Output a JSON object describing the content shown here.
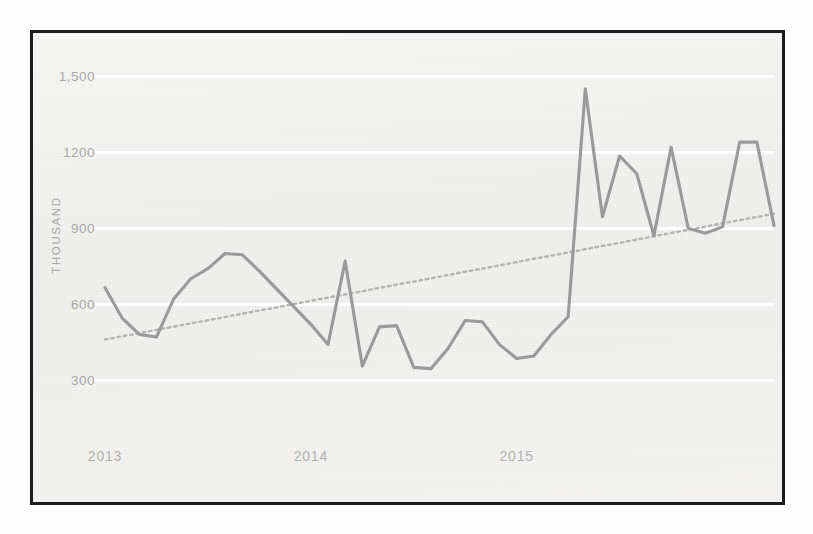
{
  "figure": {
    "frame_color": "#1c1c1c",
    "background_color": "#f2f2f0"
  },
  "chart_data": {
    "type": "line",
    "title": "",
    "subtitle": "",
    "xlabel": "",
    "ylabel": "THOUSAND",
    "ylim": [
      150,
      1600
    ],
    "yticks": [
      300,
      600,
      900,
      1200,
      1500
    ],
    "ytick_labels": [
      "300",
      "600",
      "900",
      "1200",
      "1,500"
    ],
    "xticks": [
      0,
      12,
      24
    ],
    "xtick_labels": [
      "2013",
      "2014",
      "2015"
    ],
    "grid": "horizontal",
    "legend_position": "none",
    "series": [
      {
        "name": "monthly-value",
        "type": "line",
        "color": "#9a9a9a",
        "style": "solid",
        "values": [
          665,
          545,
          480,
          470,
          620,
          700,
          740,
          800,
          795,
          730,
          660,
          590,
          520,
          440,
          770,
          355,
          510,
          515,
          350,
          345,
          425,
          535,
          530,
          440,
          385,
          395,
          480,
          550,
          1450,
          945,
          1185,
          1115,
          870,
          1220,
          900,
          880,
          905,
          1240,
          1240,
          910
        ]
      },
      {
        "name": "linear-trend",
        "type": "line",
        "color": "#b4b4b2",
        "style": "dotted",
        "values": [
          460,
          473,
          485,
          498,
          511,
          524,
          536,
          549,
          562,
          575,
          587,
          600,
          613,
          626,
          638,
          651,
          664,
          677,
          689,
          702,
          715,
          728,
          740,
          753,
          766,
          779,
          791,
          804,
          817,
          830,
          842,
          855,
          868,
          881,
          893,
          906,
          919,
          932,
          944,
          957
        ]
      }
    ]
  }
}
